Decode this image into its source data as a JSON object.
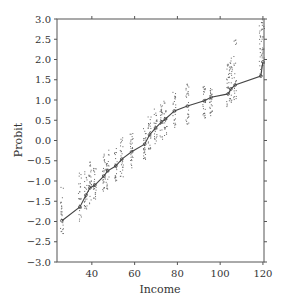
{
  "chart_data": {
    "type": "scatter",
    "title": "",
    "xlabel": "Income",
    "ylabel": "Probit",
    "xlim": [
      23.7,
      120.5
    ],
    "ylim": [
      -3.0,
      3.0
    ],
    "xticks": [
      40,
      60,
      80,
      100,
      120
    ],
    "yticks": [
      3.0,
      2.5,
      2.0,
      1.5,
      1.0,
      0.5,
      0.0,
      -0.5,
      -1.0,
      -1.5,
      -2.0,
      -2.5,
      -3.0
    ],
    "ytick_labels": [
      "3.0",
      "2.5",
      "2.0",
      "1.5",
      "1.0",
      "0.5",
      "0.0",
      "−0.5",
      "−1.0",
      "−1.5",
      "−2.0",
      "−2.5",
      "−3.0"
    ],
    "xtick_labels": [
      "40",
      "60",
      "80",
      "100",
      "120"
    ],
    "grid": false,
    "legend": null,
    "series": [
      {
        "name": "fitted probit line",
        "kind": "line",
        "color": "#444444",
        "x": [
          26,
          34.4,
          37.2,
          39.1,
          41.4,
          45.6,
          47.4,
          51.2,
          54,
          58.6,
          64.7,
          67,
          69.8,
          72.6,
          74.4,
          78.6,
          84.7,
          92.6,
          95.8,
          103.7,
          105,
          107,
          119,
          120
        ],
        "y": [
          -1.98,
          -1.64,
          -1.35,
          -1.17,
          -1.1,
          -0.88,
          -0.75,
          -0.63,
          -0.46,
          -0.28,
          -0.09,
          0.14,
          0.31,
          0.46,
          0.53,
          0.73,
          0.85,
          0.98,
          1.07,
          1.15,
          1.27,
          1.37,
          1.59,
          1.94
        ]
      },
      {
        "name": "simulated draws",
        "kind": "scatter-columns",
        "color": "#555555",
        "columns": [
          {
            "x": 26,
            "ymin": -2.4,
            "ymax": -1.1
          },
          {
            "x": 34.4,
            "ymin": -2.0,
            "ymax": -0.75
          },
          {
            "x": 37.2,
            "ymin": -1.7,
            "ymax": -0.6
          },
          {
            "x": 39.1,
            "ymin": -1.6,
            "ymax": -0.5
          },
          {
            "x": 41.4,
            "ymin": -1.5,
            "ymax": -0.6
          },
          {
            "x": 45.6,
            "ymin": -1.3,
            "ymax": -0.3
          },
          {
            "x": 47.4,
            "ymin": -1.2,
            "ymax": -0.2
          },
          {
            "x": 51.2,
            "ymin": -1.0,
            "ymax": -0.1
          },
          {
            "x": 54,
            "ymin": -0.9,
            "ymax": 0.1
          },
          {
            "x": 58.6,
            "ymin": -0.7,
            "ymax": 0.2
          },
          {
            "x": 64.7,
            "ymin": -0.5,
            "ymax": 0.3
          },
          {
            "x": 67,
            "ymin": -0.3,
            "ymax": 0.6
          },
          {
            "x": 69.8,
            "ymin": -0.1,
            "ymax": 0.8
          },
          {
            "x": 72.6,
            "ymin": 0.0,
            "ymax": 0.9
          },
          {
            "x": 74.4,
            "ymin": 0.1,
            "ymax": 1.0
          },
          {
            "x": 78.6,
            "ymin": 0.3,
            "ymax": 1.2
          },
          {
            "x": 84.7,
            "ymin": 0.4,
            "ymax": 1.4
          },
          {
            "x": 92.6,
            "ymin": 0.55,
            "ymax": 1.35
          },
          {
            "x": 95.8,
            "ymin": 0.6,
            "ymax": 1.3
          },
          {
            "x": 103.7,
            "ymin": 0.75,
            "ymax": 1.9
          },
          {
            "x": 105,
            "ymin": 0.9,
            "ymax": 2.05
          },
          {
            "x": 107,
            "ymin": 1.0,
            "ymax": 2.5
          },
          {
            "x": 119,
            "ymin": 1.6,
            "ymax": 2.95
          },
          {
            "x": 120,
            "ymin": 1.7,
            "ymax": 3.0
          }
        ]
      }
    ]
  }
}
